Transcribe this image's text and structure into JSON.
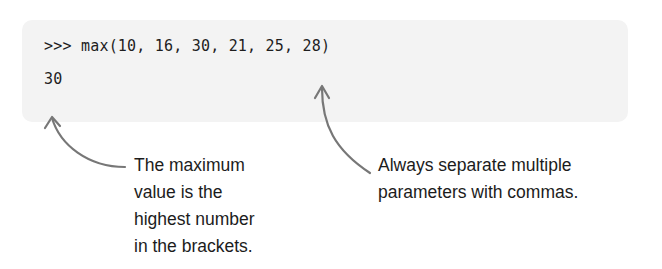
{
  "code_panel": {
    "input_line": {
      "prompt": ">>>",
      "code": "max(10, 16, 30, 21, 25, 28)"
    },
    "output_line": "30",
    "background_color": "#f3f3f3",
    "text_color": "#1e1e1e"
  },
  "annotations": {
    "left": {
      "lines": [
        "The maximum",
        "value is the",
        "highest number",
        "in the brackets."
      ],
      "points_to": "output 30"
    },
    "right": {
      "lines": [
        "Always separate multiple",
        "parameters with commas."
      ],
      "points_to": "comma after 21"
    }
  },
  "arrows": {
    "color": "#777777",
    "left": {
      "icon": "curved-arrow-up-icon"
    },
    "right": {
      "icon": "curved-arrow-up-icon"
    }
  }
}
